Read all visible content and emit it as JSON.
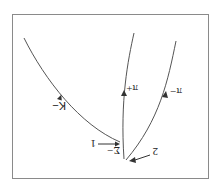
{
  "diagram": {
    "type": "particle-decay-track-diagram",
    "orientation": "rotated-180",
    "frame_color": "#8a8a8a",
    "track_color": "#555555",
    "tracks": [
      {
        "id": "kminus",
        "label": "K−"
      },
      {
        "id": "piplus",
        "label": "π+"
      },
      {
        "id": "piminus",
        "label": "π−"
      },
      {
        "id": "sigmaminus",
        "label": "Σ−"
      }
    ],
    "vertices": [
      {
        "id": "v1",
        "label": "1"
      },
      {
        "id": "v2",
        "label": "2"
      }
    ]
  }
}
